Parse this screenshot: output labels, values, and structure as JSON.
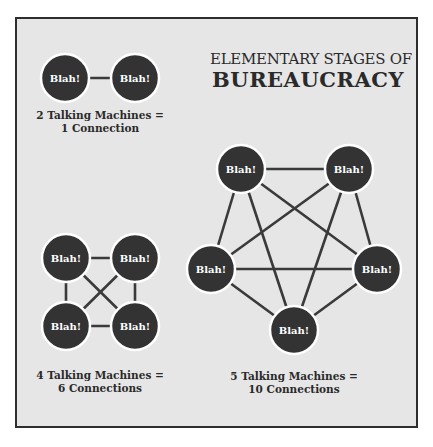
{
  "title": {
    "line1": "ELEMENTARY STAGES OF",
    "line2": "BUREAUCRACY"
  },
  "node_label": "Blah!",
  "colors": {
    "node_fill": "#333333",
    "node_stroke": "#ffffff",
    "edge": "#3a3a3a",
    "background": "#e6e6e6",
    "frame": "#2e2e2e",
    "text": "#2a2a2a"
  },
  "groups": [
    {
      "id": "two",
      "caption_line1": "2 Talking Machines =",
      "caption_line2": "1 Connection",
      "machines": 2,
      "connections": 1
    },
    {
      "id": "four",
      "caption_line1": "4 Talking Machines =",
      "caption_line2": "6 Connections",
      "machines": 4,
      "connections": 6
    },
    {
      "id": "five",
      "caption_line1": "5 Talking Machines =",
      "caption_line2": "10 Connections",
      "machines": 5,
      "connections": 10
    }
  ]
}
